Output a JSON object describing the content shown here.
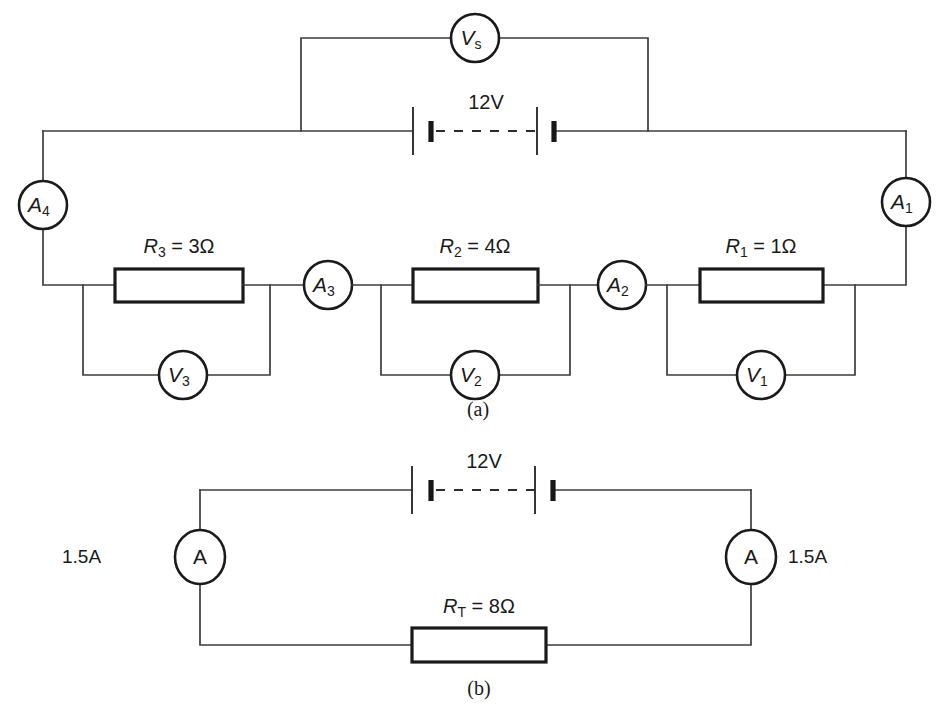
{
  "figure": {
    "panel_a_caption": "(a)",
    "panel_b_caption": "(b)"
  },
  "panel_a": {
    "source_voltmeter": {
      "symbol": "V",
      "subscript": "s",
      "name": "source-voltmeter"
    },
    "battery": {
      "label": "12V",
      "voltage": 12,
      "unit": "V"
    },
    "ammeters": [
      {
        "symbol": "A",
        "subscript": "1",
        "name": "ammeter-a1"
      },
      {
        "symbol": "A",
        "subscript": "2",
        "name": "ammeter-a2"
      },
      {
        "symbol": "A",
        "subscript": "3",
        "name": "ammeter-a3"
      },
      {
        "symbol": "A",
        "subscript": "4",
        "name": "ammeter-a4"
      }
    ],
    "resistors": [
      {
        "symbol": "R",
        "subscript": "1",
        "equals": " = ",
        "value": "1Ω",
        "label": "R1 = 1Ω",
        "ohms": 1
      },
      {
        "symbol": "R",
        "subscript": "2",
        "equals": " = ",
        "value": "4Ω",
        "label": "R2 = 4Ω",
        "ohms": 4
      },
      {
        "symbol": "R",
        "subscript": "3",
        "equals": " = ",
        "value": "3Ω",
        "label": "R3 = 3Ω",
        "ohms": 3
      }
    ],
    "voltmeters": [
      {
        "symbol": "V",
        "subscript": "1",
        "name": "voltmeter-v1"
      },
      {
        "symbol": "V",
        "subscript": "2",
        "name": "voltmeter-v2"
      },
      {
        "symbol": "V",
        "subscript": "3",
        "name": "voltmeter-v3"
      }
    ]
  },
  "panel_b": {
    "battery": {
      "label": "12V",
      "voltage": 12,
      "unit": "V"
    },
    "ammeter_left": {
      "symbol": "A",
      "reading": "1.5A",
      "name": "ammeter-left"
    },
    "ammeter_right": {
      "symbol": "A",
      "reading": "1.5A",
      "name": "ammeter-right"
    },
    "total_resistor": {
      "symbol": "R",
      "subscript": "T",
      "equals": " = ",
      "value": "8Ω",
      "label": "RT = 8Ω",
      "ohms": 8
    }
  },
  "colors": {
    "wire": "#3b3b42",
    "component_outline": "#1a1a1a",
    "background": "#ffffff"
  }
}
